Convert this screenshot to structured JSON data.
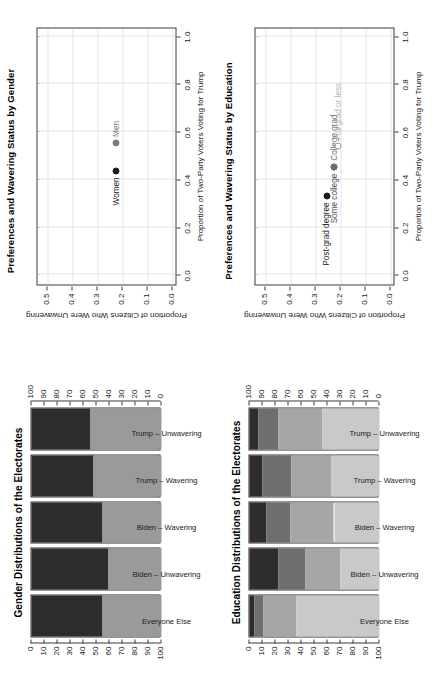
{
  "figure": {
    "orientation": "rotated-90-ccw",
    "background": "#ffffff"
  },
  "panels": {
    "gender_scatter": {
      "title": "Preferences and Wavering Status by Gender",
      "xlabel": "Proportion of Two-Party Voters Voting for Trump",
      "ylabel": "Proportion of Citizens Who Were Unwavering",
      "xticks": [
        "0.0",
        "0.2",
        "0.4",
        "0.6",
        "0.8",
        "1.0"
      ],
      "yticks": [
        "0.0",
        "0.1",
        "0.2",
        "0.3",
        "0.4",
        "0.5"
      ]
    },
    "education_scatter": {
      "title": "Preferences and Wavering Status by Education",
      "xlabel": "Proportion of Two-Party Voters Voting for Trump",
      "ylabel": "Proportion of Citizens Who Were Unwavering",
      "xticks": [
        "0.0",
        "0.2",
        "0.4",
        "0.6",
        "0.8",
        "1.0"
      ],
      "yticks": [
        "0.0",
        "0.1",
        "0.2",
        "0.3",
        "0.4",
        "0.5"
      ]
    },
    "gender_bars": {
      "title": "Gender Distributions of the Electorates",
      "axis_left_ticks": [
        "0",
        "10",
        "20",
        "30",
        "40",
        "50",
        "60",
        "70",
        "80",
        "90",
        "100"
      ],
      "axis_right_ticks": [
        "100",
        "90",
        "80",
        "70",
        "60",
        "50",
        "40",
        "30",
        "20",
        "10",
        "0"
      ]
    },
    "education_bars": {
      "title": "Education Distributions of the Electorates",
      "axis_left_ticks": [
        "0",
        "10",
        "20",
        "30",
        "40",
        "50",
        "60",
        "70",
        "80",
        "90",
        "100"
      ],
      "axis_right_ticks": [
        "100",
        "90",
        "80",
        "70",
        "60",
        "50",
        "40",
        "30",
        "20",
        "10",
        "0"
      ]
    }
  },
  "chart_data": [
    {
      "id": "gender_scatter",
      "type": "scatter",
      "title": "Preferences and Wavering Status by Gender",
      "xlabel": "Proportion of Two-Party Voters Voting for Trump",
      "ylabel": "Proportion of Citizens Who Were Unwavering",
      "xlim": [
        -0.04,
        1.04
      ],
      "ylim": [
        -0.02,
        0.54
      ],
      "xticks": [
        0.0,
        0.2,
        0.4,
        0.6,
        0.8,
        1.0
      ],
      "yticks": [
        0.0,
        0.1,
        0.2,
        0.3,
        0.4,
        0.5
      ],
      "grid": true,
      "legend": "none",
      "points": [
        {
          "label": "Women",
          "x": 0.44,
          "y": 0.222,
          "color": "#1c1c1c",
          "label_side": "left"
        },
        {
          "label": "Men",
          "x": 0.555,
          "y": 0.222,
          "color": "#7a7a7a",
          "label_side": "right"
        }
      ]
    },
    {
      "id": "education_scatter",
      "type": "scatter",
      "title": "Preferences and Wavering Status by Education",
      "xlabel": "Proportion of Two-Party Voters Voting for Trump",
      "ylabel": "Proportion of Citizens Who Were Unwavering",
      "xlim": [
        -0.04,
        1.04
      ],
      "ylim": [
        -0.02,
        0.54
      ],
      "xticks": [
        0.0,
        0.2,
        0.4,
        0.6,
        0.8,
        1.0
      ],
      "yticks": [
        0.0,
        0.1,
        0.2,
        0.3,
        0.4,
        0.5
      ],
      "grid": true,
      "legend": "none",
      "points": [
        {
          "label": "Post-grad degree",
          "x": 0.335,
          "y": 0.252,
          "color": "#1c1c1c",
          "label_side": "left"
        },
        {
          "label": "Some college",
          "x": 0.455,
          "y": 0.222,
          "color": "#4d4d4d",
          "label_side": "left"
        },
        {
          "label": "College grad",
          "x": 0.455,
          "y": 0.222,
          "color": "#6e6e6e",
          "label_side": "right"
        },
        {
          "label": "HS grad or less",
          "x": 0.545,
          "y": 0.205,
          "color": "#b5b5b5",
          "label_side": "right"
        }
      ]
    },
    {
      "id": "gender_bars",
      "type": "bar",
      "subtype": "stacked-100-horizontal",
      "title": "Gender Distributions of the Electorates",
      "xlabel": "",
      "ylabel": "",
      "ylim": [
        0,
        100
      ],
      "categories": [
        "Everyone Else",
        "Biden - Unwavering",
        "Biden - Wavering",
        "Trump - Wavering",
        "Trump - Unwavering"
      ],
      "series": [
        {
          "name": "Women",
          "color": "#2d2d2d",
          "values": [
            54.5,
            59.0,
            54.5,
            48.0,
            45.5
          ]
        },
        {
          "name": "Men",
          "color": "#9a9a9a",
          "values": [
            45.5,
            41.0,
            45.5,
            52.0,
            54.5
          ]
        }
      ]
    },
    {
      "id": "education_bars",
      "type": "bar",
      "subtype": "stacked-100-horizontal",
      "title": "Education Distributions of the Electorates",
      "xlabel": "",
      "ylabel": "",
      "ylim": [
        0,
        100
      ],
      "categories": [
        "Everyone Else",
        "Biden - Unwavering",
        "Biden - Wavering",
        "Trump - Wavering",
        "Trump - Unwavering"
      ],
      "series": [
        {
          "name": "Post-grad degree",
          "color": "#2d2d2d",
          "values": [
            4.0,
            22.0,
            13.0,
            10.0,
            7.0
          ]
        },
        {
          "name": "College grad",
          "color": "#6e6e6e",
          "values": [
            7.0,
            21.0,
            18.5,
            22.5,
            15.5
          ]
        },
        {
          "name": "Some college",
          "color": "#a6a6a6",
          "values": [
            25.0,
            27.0,
            33.5,
            30.5,
            34.0
          ]
        },
        {
          "name": "HS grad or less",
          "color": "#c9c9c9",
          "values": [
            64.0,
            30.0,
            35.0,
            37.0,
            43.5
          ]
        }
      ]
    }
  ]
}
